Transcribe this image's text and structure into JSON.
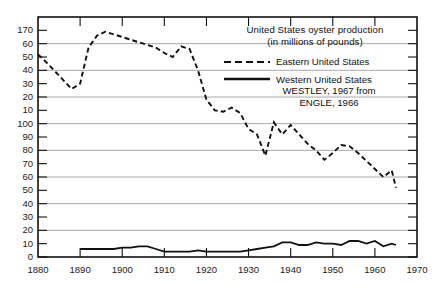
{
  "chart_data": {
    "type": "line",
    "title": "United States oyster production",
    "subtitle": "(in millions of pounds)",
    "xlabel": "",
    "ylabel": "",
    "xlim": [
      1880,
      1970
    ],
    "ylim": [
      0,
      180
    ],
    "grid": true,
    "legend_position": "top-right",
    "x_ticks": [
      1880,
      1890,
      1900,
      1910,
      1920,
      1930,
      1940,
      1950,
      1960,
      1970
    ],
    "x_tick_labels": [
      "1880",
      "1890",
      "1900",
      "1910",
      "1920",
      "1930",
      "1940",
      "1950",
      "1960",
      "1970"
    ],
    "y_ticks": [
      180,
      170,
      160,
      150,
      140,
      130,
      120,
      110,
      100,
      90,
      80,
      70,
      60,
      50,
      40,
      30,
      20,
      10,
      0
    ],
    "y_tick_labels": [
      "",
      "170",
      "60",
      "50",
      "40",
      "30",
      "20",
      "10",
      "100",
      "90",
      "80",
      "70",
      "60",
      "50",
      "40",
      "30",
      "20",
      "10",
      "0"
    ],
    "note_on_labels": "As printed in the scanned original: the hundreds digit is dropped on the 160-110 labels, which read 60, 50, 40, 30, 20, 10.",
    "annotations": [
      "WESTLEY, 1967 from",
      "ENGLE, 1966"
    ],
    "series": [
      {
        "name": "Eastern United States",
        "style": "dashed",
        "color": "#111111",
        "x": [
          1880,
          1882,
          1885,
          1888,
          1890,
          1892,
          1894,
          1896,
          1898,
          1900,
          1902,
          1904,
          1906,
          1908,
          1910,
          1912,
          1914,
          1916,
          1918,
          1920,
          1922,
          1924,
          1926,
          1928,
          1930,
          1932,
          1934,
          1936,
          1938,
          1940,
          1942,
          1944,
          1946,
          1948,
          1950,
          1952,
          1954,
          1956,
          1958,
          1960,
          1962,
          1964,
          1965
        ],
        "values": [
          152,
          146,
          136,
          126,
          130,
          157,
          166,
          169,
          167,
          165,
          163,
          161,
          159,
          157,
          153,
          150,
          158,
          156,
          140,
          118,
          110,
          109,
          112,
          108,
          96,
          92,
          76,
          101,
          92,
          99,
          92,
          85,
          80,
          73,
          78,
          84,
          83,
          78,
          72,
          66,
          60,
          65,
          52
        ]
      },
      {
        "name": "Western United States",
        "style": "solid",
        "color": "#111111",
        "x": [
          1890,
          1892,
          1894,
          1896,
          1898,
          1900,
          1902,
          1904,
          1906,
          1908,
          1910,
          1912,
          1914,
          1916,
          1918,
          1920,
          1922,
          1924,
          1926,
          1928,
          1930,
          1932,
          1934,
          1936,
          1938,
          1940,
          1942,
          1944,
          1946,
          1948,
          1950,
          1952,
          1954,
          1956,
          1958,
          1960,
          1962,
          1964,
          1965
        ],
        "values": [
          6,
          6,
          6,
          6,
          6,
          7,
          7,
          8,
          8,
          6,
          4,
          4,
          4,
          4,
          5,
          4,
          4,
          4,
          4,
          4,
          5,
          6,
          7,
          8,
          11,
          11,
          9,
          9,
          11,
          10,
          10,
          9,
          12,
          12,
          10,
          12,
          8,
          10,
          9
        ]
      }
    ]
  },
  "legend": {
    "title_line1": "United States oyster production",
    "title_line2": "(in millions of pounds)",
    "entry_eastern": "Eastern United States",
    "entry_western": "Western United States",
    "credit_line1": "WESTLEY, 1967 from",
    "credit_line2": "ENGLE, 1966"
  },
  "colors": {
    "axis": "#111111",
    "grid": "#a9a9a9",
    "line": "#111111",
    "background": "#ffffff",
    "text": "#1a1a1a"
  }
}
